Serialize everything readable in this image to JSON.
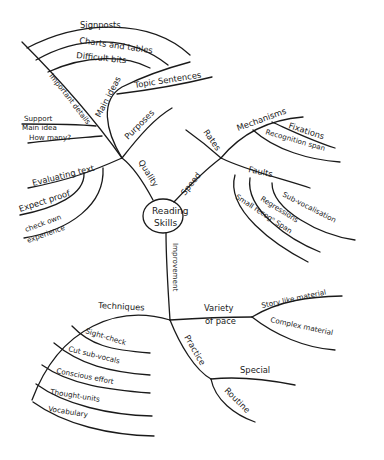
{
  "central": {
    "line1": "Reading",
    "line2": "Skills"
  },
  "branches": {
    "quality": {
      "label": "Quality",
      "purposes": "Purposes",
      "important_details": "Important details",
      "main_ideas": "Main ideas",
      "topic_sentences": "Topic Sentences",
      "signposts": "Signposts",
      "charts_and_tables": "Charts and tables",
      "difficult_bits": "Difficult bits",
      "support": "Support",
      "main_idea": "Main idea",
      "how_many": "How many?",
      "evaluating_text": "Evaluating text",
      "expect_proof": "Expect proof",
      "check_own": "check own",
      "experience": "experience"
    },
    "speed": {
      "label": "Speed",
      "rates": "Rates",
      "mechanisms": "Mechanisms",
      "fixations": "Fixations",
      "recognition_span": "Recognition span",
      "faults": "Faults",
      "sub_vocalisation": "Sub-vocalisation",
      "regressions": "Regressions",
      "small_recog_span": "Small recogⁿ Span"
    },
    "improvement": {
      "label": "Improvement",
      "techniques": "Techniques",
      "sight_check": "Sight-check",
      "cut_sub_vocals": "Cut sub-vocals",
      "conscious_effort": "Conscious effort",
      "thought_units": "Thought-units",
      "vocabulary": "Vocabulary",
      "variety_line1": "Variety",
      "variety_line2": "of pace",
      "story_like": "Story like material",
      "complex_material": "Complex material",
      "practice": "Practice",
      "special": "Special",
      "routine": "Routine"
    }
  }
}
